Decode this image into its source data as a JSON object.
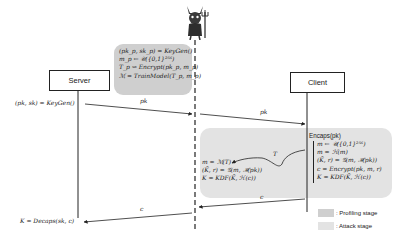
{
  "actors": {
    "server": {
      "label": "Server"
    },
    "client": {
      "label": "Client"
    },
    "attacker": {
      "icon": "devil-icon"
    }
  },
  "profiling_stage": {
    "steps": [
      "(pk_p, sk_p) = KeyGen()",
      "m_p ← 𝒰({0,1}²⁵⁶)",
      "T_p ⇝ Encrypt(pk_p, m_p)",
      "ℳ = TrainModel(T_p, m_p)"
    ]
  },
  "server_step": "(pk, sk) = KeyGen()",
  "messages": {
    "pk_to_attacker": "pk",
    "pk_to_client": "pk",
    "trace": "T",
    "c_to_attacker": "c",
    "c_to_server": "c"
  },
  "client_steps": {
    "header": "Encaps(pk)",
    "steps": [
      "m ← 𝒰({0,1}²⁵⁶)",
      "m = ℋ(m)",
      "(K̄, r) = 𝒢(m, ℋ(pk))",
      "c = Encrypt(pk, m, r)",
      "K = KDF(K̄, ℋ(c))"
    ]
  },
  "attack_steps": [
    "m = ℳ(T)",
    "(K̄, r) = 𝒢(m, ℋ(pk))",
    "K = KDF(K̄, ℋ(c))"
  ],
  "server_final": "K = Decaps(sk, c)",
  "legend": [
    {
      "label": ": Profiling stage",
      "color": "#cfcfcf"
    },
    {
      "label": ": Attack stage",
      "color": "#e3e3e3"
    }
  ]
}
